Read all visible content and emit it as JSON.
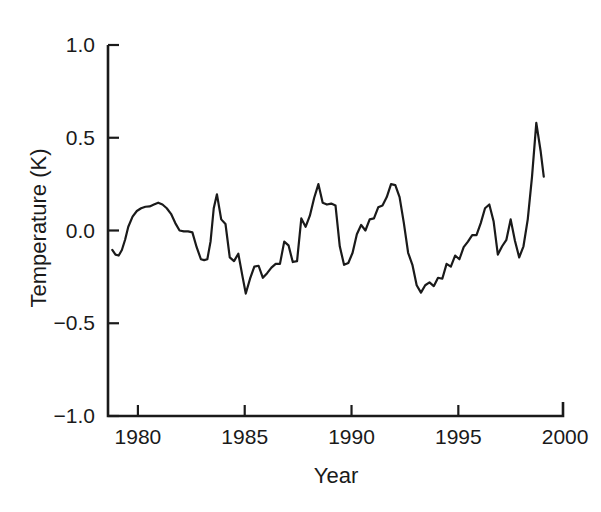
{
  "chart_data": {
    "type": "line",
    "title": "",
    "xlabel": "Year",
    "ylabel": "Temperature (K)",
    "xlim": [
      1978.6,
      1999.9
    ],
    "ylim": [
      -1.0,
      1.0
    ],
    "grid": false,
    "legend": null,
    "xticks": [
      1980,
      1985,
      1990,
      1995,
      2000
    ],
    "xtick_labels": [
      "1980",
      "1985",
      "1990",
      "1995",
      "2000"
    ],
    "yticks": [
      -1.0,
      -0.5,
      0.0,
      0.5,
      1.0
    ],
    "ytick_labels": [
      "−1.0",
      "−0.5",
      "0.0",
      "0.5",
      "1.0"
    ],
    "line_color": "#1a1a1a",
    "series": [
      {
        "name": "Global mean temperature anomaly",
        "x": [
          1978.8,
          1978.95,
          1979.1,
          1979.25,
          1979.4,
          1979.55,
          1979.75,
          1979.95,
          1980.15,
          1980.35,
          1980.55,
          1980.75,
          1980.95,
          1981.15,
          1981.35,
          1981.55,
          1981.75,
          1981.95,
          1982.15,
          1982.35,
          1982.55,
          1982.75,
          1982.95,
          1983.1,
          1983.25,
          1983.4,
          1983.55,
          1983.7,
          1983.9,
          1984.1,
          1984.3,
          1984.5,
          1984.7,
          1984.9,
          1985.05,
          1985.25,
          1985.45,
          1985.65,
          1985.85,
          1986.05,
          1986.25,
          1986.45,
          1986.65,
          1986.85,
          1987.05,
          1987.25,
          1987.45,
          1987.65,
          1987.85,
          1988.05,
          1988.25,
          1988.45,
          1988.65,
          1988.85,
          1989.05,
          1989.25,
          1989.45,
          1989.65,
          1989.85,
          1990.05,
          1990.25,
          1990.45,
          1990.65,
          1990.85,
          1991.05,
          1991.25,
          1991.45,
          1991.65,
          1991.85,
          1992.05,
          1992.25,
          1992.45,
          1992.65,
          1992.85,
          1993.05,
          1993.25,
          1993.45,
          1993.65,
          1993.85,
          1994.05,
          1994.25,
          1994.45,
          1994.65,
          1994.85,
          1995.05,
          1995.25,
          1995.45,
          1995.65,
          1995.85,
          1996.05,
          1996.25,
          1996.45,
          1996.65,
          1996.85,
          1997.05,
          1997.25,
          1997.45,
          1997.65,
          1997.85,
          1998.05,
          1998.25,
          1998.45,
          1998.65,
          1998.85,
          1999.0
        ],
        "y": [
          -0.105,
          -0.13,
          -0.135,
          -0.105,
          -0.05,
          0.02,
          0.075,
          0.105,
          0.12,
          0.128,
          0.13,
          0.14,
          0.15,
          0.14,
          0.12,
          0.09,
          0.04,
          0.0,
          -0.005,
          -0.005,
          -0.01,
          -0.09,
          -0.155,
          -0.16,
          -0.155,
          -0.06,
          0.12,
          0.195,
          0.06,
          0.035,
          -0.145,
          -0.165,
          -0.125,
          -0.25,
          -0.34,
          -0.26,
          -0.195,
          -0.19,
          -0.255,
          -0.23,
          -0.2,
          -0.18,
          -0.18,
          -0.06,
          -0.08,
          -0.17,
          -0.165,
          0.065,
          0.02,
          0.08,
          0.175,
          0.25,
          0.15,
          0.14,
          0.145,
          0.135,
          -0.085,
          -0.185,
          -0.175,
          -0.12,
          -0.02,
          0.03,
          0.0,
          0.06,
          0.065,
          0.125,
          0.135,
          0.18,
          0.25,
          0.245,
          0.18,
          0.04,
          -0.12,
          -0.185,
          -0.295,
          -0.335,
          -0.295,
          -0.28,
          -0.3,
          -0.255,
          -0.26,
          -0.18,
          -0.195,
          -0.135,
          -0.155,
          -0.09,
          -0.06,
          -0.025,
          -0.025,
          0.04,
          0.12,
          0.14,
          0.05,
          -0.13,
          -0.085,
          -0.05,
          0.06,
          -0.055,
          -0.145,
          -0.085,
          0.06,
          0.29,
          0.58,
          0.43,
          0.29
        ]
      }
    ]
  },
  "axes": {
    "y_title": "Temperature (K)",
    "x_title": "Year"
  }
}
